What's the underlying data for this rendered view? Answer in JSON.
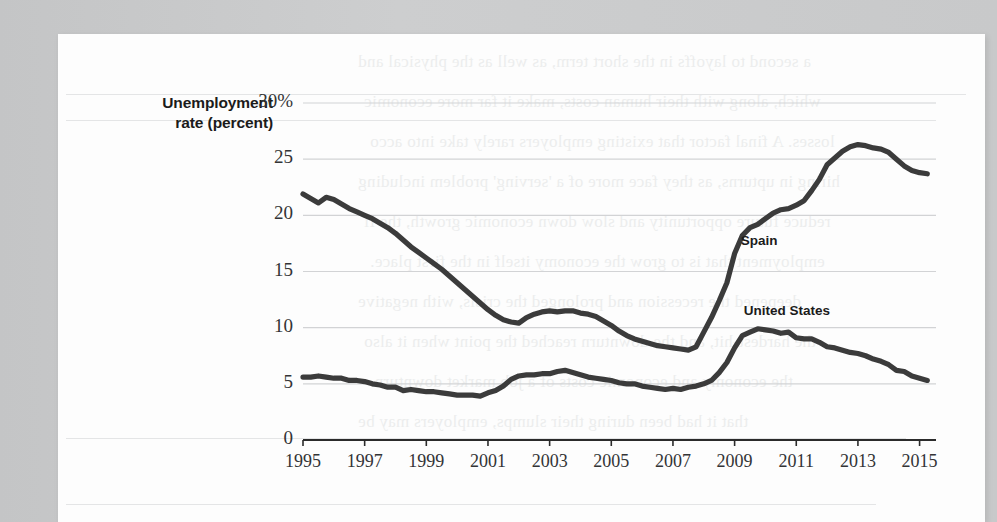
{
  "page": {
    "background_color": "#c9cacb",
    "card_color": "#fdfdfd"
  },
  "chart_data": {
    "type": "line",
    "title": "Unemployment rate (percent)",
    "title_line1": "Unemployment",
    "title_line2": "rate (percent)",
    "xlabel": "",
    "ylabel": "Unemployment rate (percent)",
    "xlim": [
      1995,
      2015.5
    ],
    "ylim": [
      0,
      30
    ],
    "grid": true,
    "gridlines_y": [
      5,
      10,
      15,
      20,
      25,
      30
    ],
    "legend_position": "inline-annotation",
    "ytick_labels": [
      "30%",
      "25",
      "20",
      "15",
      "10",
      "5",
      "0"
    ],
    "ytick_values": [
      30,
      25,
      20,
      15,
      10,
      5,
      0
    ],
    "xtick_labels": [
      "1995",
      "1997",
      "1999",
      "2001",
      "2003",
      "2005",
      "2007",
      "2009",
      "2011",
      "2013",
      "2015"
    ],
    "xtick_values": [
      1995,
      1997,
      1999,
      2001,
      2003,
      2005,
      2007,
      2009,
      2011,
      2013,
      2015
    ],
    "line_color": "#3b3b3b",
    "grid_color": "#d2d3d5",
    "axis_color": "#2b2b2b",
    "series": [
      {
        "name": "Spain",
        "label": "Spain",
        "label_x": 2009.2,
        "label_y": 17.6,
        "x": [
          1995,
          1995.25,
          1995.5,
          1995.75,
          1996,
          1996.25,
          1996.5,
          1996.75,
          1997,
          1997.25,
          1997.5,
          1997.75,
          1998,
          1998.25,
          1998.5,
          1998.75,
          1999,
          1999.25,
          1999.5,
          1999.75,
          2000,
          2000.25,
          2000.5,
          2000.75,
          2001,
          2001.25,
          2001.5,
          2001.75,
          2002,
          2002.25,
          2002.5,
          2002.75,
          2003,
          2003.25,
          2003.5,
          2003.75,
          2004,
          2004.25,
          2004.5,
          2004.75,
          2005,
          2005.25,
          2005.5,
          2005.75,
          2006,
          2006.25,
          2006.5,
          2006.75,
          2007,
          2007.25,
          2007.5,
          2007.75,
          2008,
          2008.25,
          2008.5,
          2008.75,
          2009,
          2009.25,
          2009.5,
          2009.75,
          2010,
          2010.25,
          2010.5,
          2010.75,
          2011,
          2011.25,
          2011.5,
          2011.75,
          2012,
          2012.25,
          2012.5,
          2012.75,
          2013,
          2013.25,
          2013.5,
          2013.75,
          2014,
          2014.25,
          2014.5,
          2014.75,
          2015,
          2015.25
        ],
        "values": [
          21.9,
          21.5,
          21.1,
          21.6,
          21.4,
          21.0,
          20.6,
          20.3,
          20.0,
          19.7,
          19.3,
          18.9,
          18.4,
          17.8,
          17.2,
          16.7,
          16.2,
          15.7,
          15.2,
          14.6,
          14.0,
          13.4,
          12.8,
          12.2,
          11.6,
          11.1,
          10.7,
          10.5,
          10.4,
          10.9,
          11.2,
          11.4,
          11.5,
          11.4,
          11.5,
          11.5,
          11.3,
          11.2,
          11.0,
          10.6,
          10.2,
          9.7,
          9.3,
          9.0,
          8.8,
          8.6,
          8.4,
          8.3,
          8.2,
          8.1,
          8.0,
          8.3,
          9.6,
          10.9,
          12.4,
          14.0,
          16.6,
          18.2,
          18.9,
          19.2,
          19.7,
          20.2,
          20.5,
          20.6,
          20.9,
          21.3,
          22.2,
          23.2,
          24.5,
          25.1,
          25.7,
          26.1,
          26.3,
          26.2,
          26.0,
          25.9,
          25.6,
          25.0,
          24.4,
          24.0,
          23.8,
          23.7
        ]
      },
      {
        "name": "United States",
        "label": "United States",
        "label_x": 2009.3,
        "label_y": 11.4,
        "x": [
          1995,
          1995.25,
          1995.5,
          1995.75,
          1996,
          1996.25,
          1996.5,
          1996.75,
          1997,
          1997.25,
          1997.5,
          1997.75,
          1998,
          1998.25,
          1998.5,
          1998.75,
          1999,
          1999.25,
          1999.5,
          1999.75,
          2000,
          2000.25,
          2000.5,
          2000.75,
          2001,
          2001.25,
          2001.5,
          2001.75,
          2002,
          2002.25,
          2002.5,
          2002.75,
          2003,
          2003.25,
          2003.5,
          2003.75,
          2004,
          2004.25,
          2004.5,
          2004.75,
          2005,
          2005.25,
          2005.5,
          2005.75,
          2006,
          2006.25,
          2006.5,
          2006.75,
          2007,
          2007.25,
          2007.5,
          2007.75,
          2008,
          2008.25,
          2008.5,
          2008.75,
          2009,
          2009.25,
          2009.5,
          2009.75,
          2010,
          2010.25,
          2010.5,
          2010.75,
          2011,
          2011.25,
          2011.5,
          2011.75,
          2012,
          2012.25,
          2012.5,
          2012.75,
          2013,
          2013.25,
          2013.5,
          2013.75,
          2014,
          2014.25,
          2014.5,
          2014.75,
          2015,
          2015.25
        ],
        "values": [
          5.6,
          5.6,
          5.7,
          5.6,
          5.5,
          5.5,
          5.3,
          5.3,
          5.2,
          5.0,
          4.9,
          4.7,
          4.7,
          4.4,
          4.5,
          4.4,
          4.3,
          4.3,
          4.2,
          4.1,
          4.0,
          4.0,
          4.0,
          3.9,
          4.2,
          4.4,
          4.8,
          5.4,
          5.7,
          5.8,
          5.8,
          5.9,
          5.9,
          6.1,
          6.2,
          6.0,
          5.8,
          5.6,
          5.5,
          5.4,
          5.3,
          5.1,
          5.0,
          5.0,
          4.8,
          4.7,
          4.6,
          4.5,
          4.6,
          4.5,
          4.7,
          4.8,
          5.0,
          5.3,
          6.0,
          6.9,
          8.2,
          9.3,
          9.6,
          9.9,
          9.8,
          9.7,
          9.5,
          9.6,
          9.1,
          9.0,
          9.0,
          8.7,
          8.3,
          8.2,
          8.0,
          7.8,
          7.7,
          7.5,
          7.2,
          7.0,
          6.7,
          6.2,
          6.1,
          5.7,
          5.5,
          5.3
        ]
      }
    ]
  },
  "bleed_text": {
    "lines": [
      "a second to layoffs in the short term, as well as the physical and",
      "which, along with their human costs, make it far more economic",
      "losses. A final factor that existing employers rarely take into acco",
      "hiring in upturns, as they face more of a 'serving' problem including",
      "reduce future opportunity and slow down economic growth, the fi",
      "employment that is to grow the economy itself in the first place.",
      "deepened the recession and prolonged the crisis, with negative",
      "the hardest-hit, and the downturn reached the point when it also",
      "the economy and economic costs of a job market downturn.",
      "that it had been during their slumps, employers may be"
    ]
  }
}
